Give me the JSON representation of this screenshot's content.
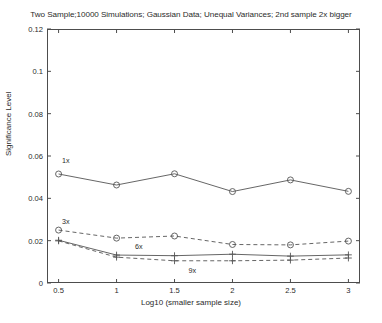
{
  "chart_data": {
    "type": "line",
    "title": "Two Sample;10000 Simulations; Gaussian Data; Unequal Variances; 2nd sample 2x bigger",
    "xlabel": "Log10 (smaller sample size)",
    "ylabel": "Significance Level",
    "x": [
      0.5,
      1,
      1.5,
      2,
      2.5,
      3
    ],
    "xlim": [
      0.4,
      3.1
    ],
    "ylim": [
      0,
      0.12
    ],
    "xticks": [
      0.5,
      1,
      1.5,
      2,
      2.5,
      3
    ],
    "xticklabels": [
      "0.5",
      "1",
      "1.5",
      "2",
      "2.5",
      "3"
    ],
    "yticks": [
      0,
      0.02,
      0.04,
      0.06,
      0.08,
      0.1,
      0.12
    ],
    "yticklabels": [
      "0",
      "0.02",
      "0.04",
      "0.06",
      "0.08",
      "0.1",
      "0.12"
    ],
    "grid": false,
    "legend": "inline-annotations",
    "series": [
      {
        "name": "1x",
        "label": "1x",
        "marker": "circle",
        "linestyle": "solid",
        "color": "#555555",
        "values": [
          0.0515,
          0.0463,
          0.0516,
          0.0432,
          0.0487,
          0.0433
        ],
        "label_x": 0.53,
        "label_y": 0.0575
      },
      {
        "name": "3x",
        "label": "3x",
        "marker": "circle",
        "linestyle": "dashed",
        "color": "#555555",
        "values": [
          0.025,
          0.0212,
          0.0222,
          0.0182,
          0.018,
          0.0198
        ],
        "label_x": 0.53,
        "label_y": 0.0288
      },
      {
        "name": "6x",
        "label": "6x",
        "marker": "plus",
        "linestyle": "solid",
        "color": "#555555",
        "values": [
          0.0202,
          0.0132,
          0.0129,
          0.0136,
          0.0127,
          0.0133
        ],
        "label_x": 1.16,
        "label_y": 0.0172
      },
      {
        "name": "9x",
        "label": "9x",
        "marker": "plus",
        "linestyle": "dashed",
        "color": "#555555",
        "values": [
          0.0199,
          0.0122,
          0.0105,
          0.0105,
          0.0108,
          0.0118
        ],
        "label_x": 1.62,
        "label_y": 0.0055
      }
    ]
  },
  "figure": {
    "background": "#ffffff",
    "axis_color": "#4d4d4d",
    "text_color": "#2b2b2b"
  }
}
